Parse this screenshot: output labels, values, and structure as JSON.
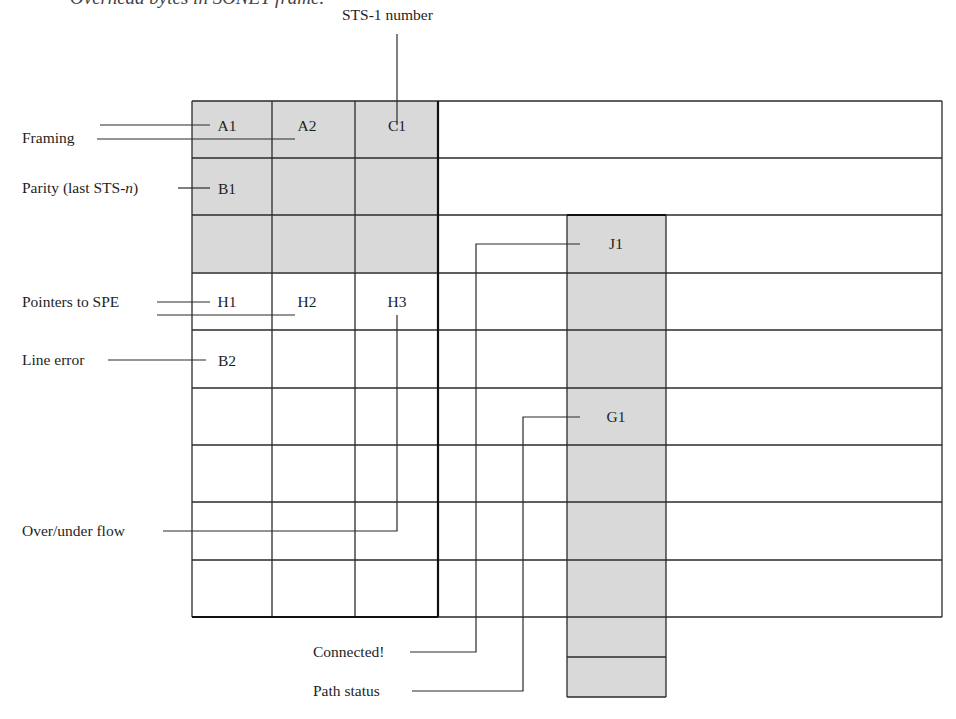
{
  "caption": "Overhead bytes in SONET frame.",
  "top_label": "STS-1 number",
  "colors": {
    "shaded": "#d9d9d9",
    "line": "#2a2a2a",
    "background": "#ffffff"
  },
  "overhead_grid": {
    "columns": 3,
    "rows": 9,
    "cells": [
      [
        "A1",
        "A2",
        "C1"
      ],
      [
        "B1",
        "",
        ""
      ],
      [
        "",
        "",
        ""
      ],
      [
        "H1",
        "H2",
        "H3"
      ],
      [
        "B2",
        "",
        ""
      ],
      [
        "",
        "",
        ""
      ],
      [
        "",
        "",
        ""
      ],
      [
        "",
        "",
        ""
      ],
      [
        "",
        "",
        ""
      ]
    ],
    "shaded_rows": [
      0,
      1,
      2
    ]
  },
  "path_overhead": {
    "cells": [
      "J1",
      "",
      "",
      "G1",
      "",
      "",
      "",
      "",
      ""
    ]
  },
  "labels": {
    "framing": "Framing",
    "parity": "Parity (last STS-",
    "parity_italic": "n",
    "parity_close": ")",
    "pointers": "Pointers to SPE",
    "line_error": "Line error",
    "overflow": "Over/under flow",
    "connected": "Connected!",
    "path_status": "Path status"
  }
}
